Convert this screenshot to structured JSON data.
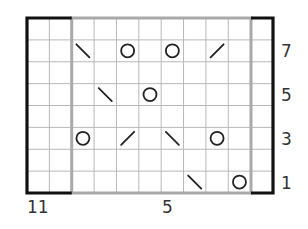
{
  "chart_data": {
    "type": "knitting-chart",
    "columns": 11,
    "rows": 8,
    "column_numbering": "right-to-left",
    "row_numbering": "bottom-to-top",
    "repeat": {
      "from_column": 2,
      "to_column": 9,
      "outline_color": "#a9a9a9"
    },
    "edge_stitches": {
      "columns": [
        11,
        10,
        1
      ],
      "outline_color": "#111111"
    },
    "symbols": {
      "yo": "O (yarn over)",
      "ssk": "\\ (left-leaning decrease)",
      "k2tog": "/ (right-leaning decrease)"
    },
    "stitches": [
      {
        "row": 7,
        "column": 9,
        "symbol": "ssk"
      },
      {
        "row": 7,
        "column": 7,
        "symbol": "yo"
      },
      {
        "row": 7,
        "column": 5,
        "symbol": "yo"
      },
      {
        "row": 7,
        "column": 3,
        "symbol": "k2tog"
      },
      {
        "row": 5,
        "column": 8,
        "symbol": "ssk"
      },
      {
        "row": 5,
        "column": 6,
        "symbol": "yo"
      },
      {
        "row": 3,
        "column": 9,
        "symbol": "yo"
      },
      {
        "row": 3,
        "column": 7,
        "symbol": "k2tog"
      },
      {
        "row": 3,
        "column": 5,
        "symbol": "ssk"
      },
      {
        "row": 3,
        "column": 3,
        "symbol": "yo"
      },
      {
        "row": 1,
        "column": 4,
        "symbol": "ssk"
      },
      {
        "row": 1,
        "column": 2,
        "symbol": "yo"
      }
    ],
    "row_labels": [
      "7",
      "5",
      "3",
      "1"
    ],
    "column_labels": [
      "11",
      "5"
    ]
  },
  "labels": {
    "row_7": "7",
    "row_5": "5",
    "row_3": "3",
    "row_1": "1",
    "col_11": "11",
    "col_5": "5"
  }
}
